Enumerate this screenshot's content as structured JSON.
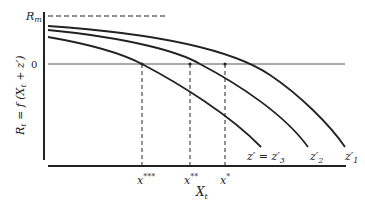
{
  "diagram": {
    "type": "economic curves diagram",
    "y_axis_label": "R_t = f (X_t + z')",
    "y_axis_label_parts": {
      "main": "R",
      "sub": "t",
      "rest": " = f (X",
      "sub2": "t",
      "tail": " + z′)"
    },
    "x_axis_label": "X_t",
    "x_axis_label_parts": {
      "main": "X",
      "sub": "t"
    },
    "y_ticks": [
      {
        "label": "R",
        "sub": "m",
        "meaning": "R_m (maximum)"
      },
      {
        "label": "0",
        "meaning": "zero level"
      }
    ],
    "x_markers": [
      {
        "label": "x",
        "sup": "***",
        "note": "intersection of z'3 curve with zero line"
      },
      {
        "label": "x",
        "sup": "**",
        "note": "intersection of z'2 curve with zero line"
      },
      {
        "label": "x",
        "sup": "*",
        "note": "intersection of z'1 curve with zero line"
      }
    ],
    "curves": [
      {
        "name": "z′₁",
        "label": "z′",
        "sub": "1",
        "order": "top/outermost"
      },
      {
        "name": "z′₂",
        "label": "z′",
        "sub": "2",
        "order": "middle"
      },
      {
        "name": "z′ = z′₃",
        "label": "z′ = z′",
        "sub": "3",
        "order": "bottom/innermost"
      }
    ],
    "colors": {
      "ink": "#222222",
      "background": "#ffffff"
    }
  }
}
